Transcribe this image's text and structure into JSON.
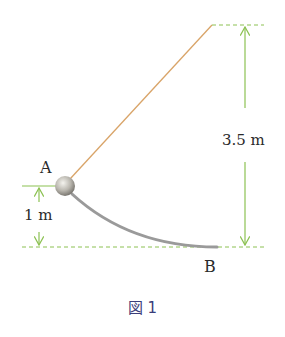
{
  "figure": {
    "caption": "図 1",
    "labels": {
      "point_a": "A",
      "point_b": "B",
      "height_ball": "1 m",
      "height_top": "3.5 m"
    },
    "colors": {
      "rope": "#d9a468",
      "dimension": "#8cc152",
      "track": "#9a9a9a",
      "ball_light": "#f0efea",
      "ball_dark": "#7d7a74",
      "caption": "#3b3d7a"
    },
    "geometry": {
      "ball_center": [
        65,
        186
      ],
      "ball_radius": 10,
      "rope_top": [
        212,
        25
      ],
      "baseline_y": 247,
      "curve_end": [
        217,
        247
      ]
    }
  }
}
